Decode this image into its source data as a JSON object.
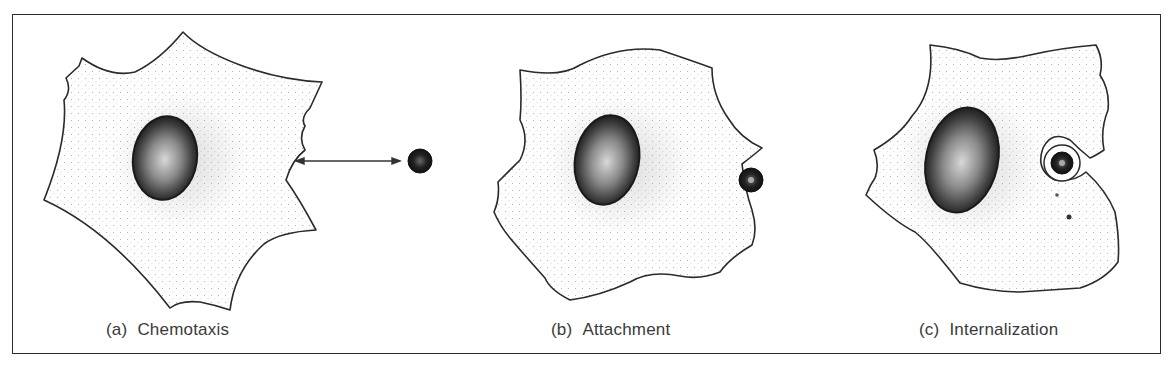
{
  "figure": {
    "panels": [
      {
        "id": "a",
        "tag": "(a)",
        "label": "Chemotaxis"
      },
      {
        "id": "b",
        "tag": "(b)",
        "label": "Attachment"
      },
      {
        "id": "c",
        "tag": "(c)",
        "label": "Internalization"
      }
    ],
    "colors": {
      "outline": "#2a2a2a",
      "stipple": "#9a9a9a",
      "nucleus": "#1e1e1e",
      "text": "#3a3a3a"
    }
  }
}
